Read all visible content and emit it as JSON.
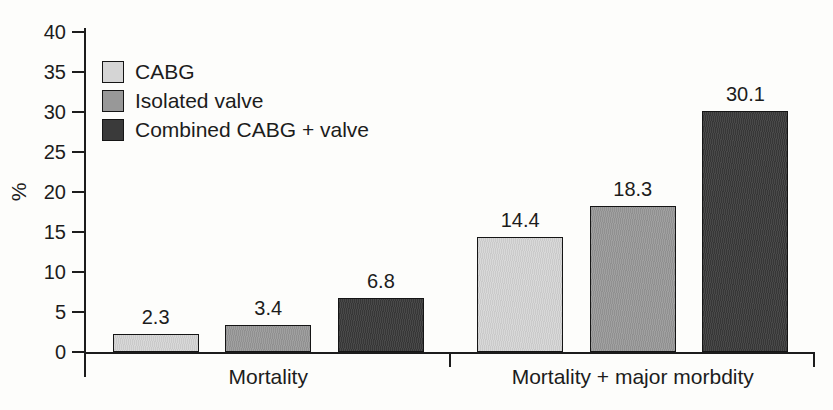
{
  "chart_data": {
    "type": "bar",
    "title": "",
    "ylabel": "%",
    "xlabel": "",
    "ylim": [
      0,
      40
    ],
    "ytick_step": 5,
    "yticks": [
      0,
      5,
      10,
      15,
      20,
      25,
      30,
      35,
      40
    ],
    "grid": false,
    "legend_position": "top-left",
    "bar_labels_shown": true,
    "categories": [
      "Mortality",
      "Mortality + major morbdity"
    ],
    "series": [
      {
        "name": "CABG",
        "color": "#d5d5d5",
        "values": [
          2.3,
          14.4
        ]
      },
      {
        "name": "Isolated valve",
        "color": "#989898",
        "values": [
          3.4,
          18.3
        ]
      },
      {
        "name": "Combined CABG + valve",
        "color": "#3a3a3a",
        "values": [
          6.8,
          30.1
        ]
      }
    ],
    "colors": {
      "axis": "#1c1c1c",
      "text": "#1c1c1c",
      "background": "#fdfdfb"
    }
  }
}
